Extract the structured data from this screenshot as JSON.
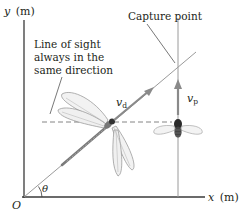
{
  "diagram": {
    "axes": {
      "y_label_var": "y",
      "y_label_unit": "(m)",
      "x_label_var": "x",
      "x_label_unit": "(m)",
      "origin_label": "O",
      "angle_label": "θ"
    },
    "annotations": {
      "capture_point": "Capture point",
      "line_of_sight_1": "Line of sight",
      "line_of_sight_2": "always in the",
      "line_of_sight_3": "same direction"
    },
    "vectors": {
      "dragonfly_velocity_base": "v",
      "dragonfly_velocity_sub": "d",
      "prey_velocity_base": "v",
      "prey_velocity_sub": "p"
    },
    "objects": {
      "predator": "dragonfly",
      "prey": "fly"
    },
    "colors": {
      "axis": "#3a3a3a",
      "vector": "#8a8a8a",
      "dashed": "#777777",
      "text": "#231f20"
    }
  }
}
